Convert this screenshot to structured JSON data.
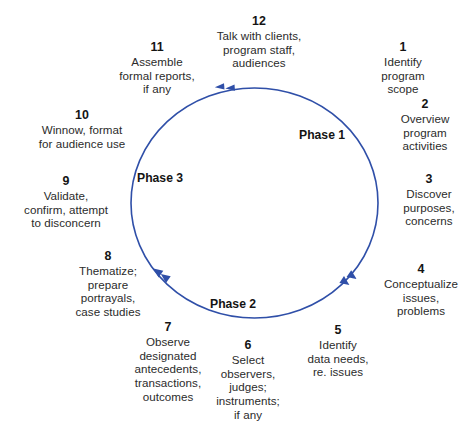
{
  "diagram": {
    "circle_color": "#2f4fa8",
    "text_color": "#2b2b2b",
    "direction": "counter-clockwise",
    "steps": [
      {
        "num": "1",
        "text": "Identify\nprogram\nscope"
      },
      {
        "num": "2",
        "text": "Overview\nprogram\nactivities"
      },
      {
        "num": "3",
        "text": "Discover\npurposes,\nconcerns"
      },
      {
        "num": "4",
        "text": "Conceptualize\nissues,\nproblems"
      },
      {
        "num": "5",
        "text": "Identify\ndata needs,\nre. issues"
      },
      {
        "num": "6",
        "text": "Select\nobservers,\njudges;\ninstruments;\nif any"
      },
      {
        "num": "7",
        "text": "Observe\ndesignated\nantecedents,\ntransactions,\noutcomes"
      },
      {
        "num": "8",
        "text": "Thematize;\nprepare\nportrayals,\ncase studies"
      },
      {
        "num": "9",
        "text": "Validate,\nconfirm, attempt\nto disconcern"
      },
      {
        "num": "10",
        "text": "Winnow, format\nfor audience use"
      },
      {
        "num": "11",
        "text": "Assemble\nformal reports,\nif any"
      },
      {
        "num": "12",
        "text": "Talk with clients,\nprogram staff,\naudiences"
      }
    ],
    "phases": [
      {
        "label": "Phase 1"
      },
      {
        "label": "Phase 2"
      },
      {
        "label": "Phase 3"
      }
    ]
  }
}
